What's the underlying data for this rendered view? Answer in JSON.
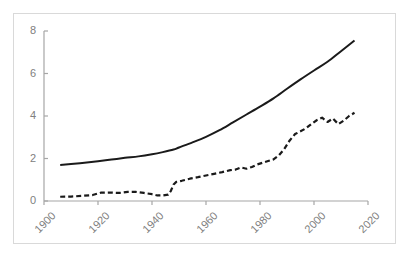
{
  "chart_data": {
    "type": "line",
    "title": "",
    "subtitle": "",
    "xlabel": "",
    "ylabel": "",
    "xlim": [
      1900,
      2020
    ],
    "ylim": [
      0,
      8
    ],
    "grid": false,
    "legend": "none",
    "xticks": [
      "1900",
      "1920",
      "1940",
      "1960",
      "1980",
      "2000",
      "2020"
    ],
    "xtick_values": [
      1900,
      1920,
      1940,
      1960,
      1980,
      2000,
      2020
    ],
    "yticks": [
      "0",
      "2",
      "4",
      "6",
      "8"
    ],
    "ytick_values": [
      0,
      2,
      4,
      6,
      8
    ],
    "series": [
      {
        "name": "solid-series",
        "style": "solid",
        "color": "#1a1a1a",
        "width": 2.0,
        "x": [
          1906,
          1910,
          1915,
          1920,
          1925,
          1930,
          1935,
          1940,
          1944,
          1948,
          1950,
          1955,
          1960,
          1965,
          1970,
          1975,
          1980,
          1985,
          1990,
          1995,
          2000,
          2005,
          2010,
          2015
        ],
        "values": [
          1.7,
          1.74,
          1.8,
          1.87,
          1.95,
          2.03,
          2.1,
          2.2,
          2.3,
          2.42,
          2.52,
          2.76,
          3.02,
          3.33,
          3.7,
          4.07,
          4.44,
          4.83,
          5.28,
          5.72,
          6.14,
          6.55,
          7.05,
          7.55
        ]
      },
      {
        "name": "dashed-series",
        "style": "dashed",
        "color": "#1a1a1a",
        "width": 2.2,
        "x": [
          1906,
          1910,
          1914,
          1918,
          1921,
          1924,
          1928,
          1931,
          1934,
          1937,
          1940,
          1942,
          1944,
          1946,
          1947,
          1948,
          1949,
          1951,
          1954,
          1957,
          1960,
          1963,
          1966,
          1969,
          1971,
          1973,
          1975,
          1977,
          1979,
          1981,
          1983,
          1985,
          1987,
          1989,
          1991,
          1993,
          1995,
          1997,
          1999,
          2001,
          2003,
          2005,
          2007,
          2009,
          2011,
          2013,
          2015
        ],
        "values": [
          0.2,
          0.21,
          0.24,
          0.28,
          0.39,
          0.4,
          0.38,
          0.43,
          0.43,
          0.38,
          0.32,
          0.26,
          0.26,
          0.3,
          0.48,
          0.78,
          0.9,
          0.95,
          1.05,
          1.12,
          1.2,
          1.28,
          1.36,
          1.45,
          1.48,
          1.58,
          1.52,
          1.6,
          1.72,
          1.8,
          1.88,
          1.96,
          2.15,
          2.45,
          2.85,
          3.15,
          3.28,
          3.42,
          3.62,
          3.8,
          3.92,
          3.72,
          3.88,
          3.62,
          3.78,
          4.0,
          4.15
        ]
      }
    ]
  },
  "axes": {
    "axis_color": "#a6a6a6",
    "tick_color": "#a6a6a6",
    "label_color": "#808080",
    "frame_color": "#d9d9d9",
    "background": "#ffffff"
  }
}
